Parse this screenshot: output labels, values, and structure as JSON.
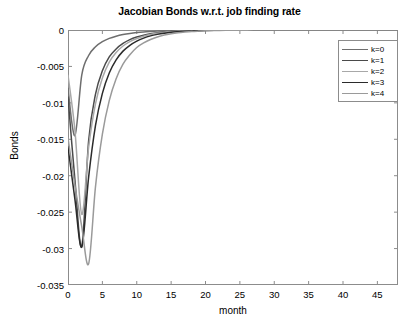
{
  "chart_data": {
    "type": "line",
    "title": "Jacobian Bonds w.r.t. job finding rate",
    "xlabel": "month",
    "ylabel": "Bonds",
    "xlim": [
      0,
      48
    ],
    "ylim": [
      -0.035,
      0
    ],
    "xticks": [
      0,
      5,
      10,
      15,
      20,
      25,
      30,
      35,
      40,
      45
    ],
    "xticklabels": [
      "0",
      "5",
      "10",
      "15",
      "20",
      "25",
      "30",
      "35",
      "40",
      "45"
    ],
    "yticks": [
      0,
      -0.005,
      -0.01,
      -0.015,
      -0.02,
      -0.025,
      -0.03,
      -0.035
    ],
    "yticklabels": [
      "0",
      "-0.005",
      "-0.01",
      "-0.015",
      "-0.02",
      "-0.025",
      "-0.03",
      "-0.035"
    ],
    "grid": false,
    "legend_position": "upper-right",
    "x": [
      0,
      1,
      2,
      3,
      4,
      5,
      6,
      7,
      8,
      9,
      10,
      11,
      12,
      13,
      14,
      15,
      16,
      17,
      18,
      19,
      20,
      22,
      24,
      26,
      28,
      30,
      32,
      34,
      36,
      38,
      40,
      42,
      44,
      46,
      48
    ],
    "series": [
      {
        "name": "k=0",
        "color": "#6e6e6e",
        "values": [
          -0.008,
          -0.0145,
          -0.0062,
          -0.0035,
          -0.0023,
          -0.0016,
          -0.00115,
          -0.00085,
          -0.00063,
          -0.00047,
          -0.00035,
          -0.00026,
          -0.0002,
          -0.00015,
          -0.00011,
          -8e-05,
          -6e-05,
          -4.5e-05,
          -3.3e-05,
          -2.5e-05,
          -1.9e-05,
          -1.1e-05,
          -6e-06,
          -3.5e-06,
          -2e-06,
          -1.2e-06,
          -7e-07,
          -4e-07,
          -2.5e-07,
          -1.5e-07,
          -9e-08,
          -5e-08,
          -3e-08,
          -2e-08,
          -1e-08
        ]
      },
      {
        "name": "k=1",
        "color": "#4a4a4a",
        "values": [
          -0.0092,
          -0.0205,
          -0.0297,
          -0.0152,
          -0.0088,
          -0.0056,
          -0.0037,
          -0.0026,
          -0.00185,
          -0.00133,
          -0.00097,
          -0.00071,
          -0.00052,
          -0.00038,
          -0.00028,
          -0.00021,
          -0.00015,
          -0.00011,
          -8e-05,
          -6e-05,
          -4.5e-05,
          -2.5e-05,
          -1.4e-05,
          -8e-06,
          -4.5e-06,
          -2.6e-06,
          -1.5e-06,
          -9e-07,
          -5e-07,
          -3e-07,
          -1.7e-07,
          -1e-07,
          -6e-08,
          -3e-08,
          -2e-08
        ]
      },
      {
        "name": "k=2",
        "color": "#a8a8a8",
        "values": [
          -0.0062,
          -0.0137,
          -0.0253,
          -0.0161,
          -0.0101,
          -0.0066,
          -0.0044,
          -0.0031,
          -0.0022,
          -0.0016,
          -0.00116,
          -0.00085,
          -0.00062,
          -0.00046,
          -0.00034,
          -0.00025,
          -0.00018,
          -0.00013,
          -0.0001,
          -7e-05,
          -5e-05,
          -3e-05,
          -1.7e-05,
          -1e-05,
          -5.5e-06,
          -3.2e-06,
          -1.8e-06,
          -1e-06,
          -6e-07,
          -3.5e-07,
          -2e-07,
          -1.2e-07,
          -7e-08,
          -4e-08,
          -2e-08
        ]
      },
      {
        "name": "k=3",
        "color": "#2b2b2b",
        "values": [
          -0.016,
          -0.0232,
          -0.0298,
          -0.0202,
          -0.0131,
          -0.0087,
          -0.0059,
          -0.0041,
          -0.0029,
          -0.0021,
          -0.00152,
          -0.00111,
          -0.00081,
          -0.0006,
          -0.00044,
          -0.00032,
          -0.00024,
          -0.00017,
          -0.00013,
          -9e-05,
          -7e-05,
          -4e-05,
          -2.2e-05,
          -1.2e-05,
          -7e-06,
          -4e-06,
          -2.3e-06,
          -1.3e-06,
          -8e-07,
          -4.5e-07,
          -2.6e-07,
          -1.5e-07,
          -9e-08,
          -5e-08,
          -3e-08
        ]
      },
      {
        "name": "k=4",
        "color": "#9a9a9a",
        "values": [
          -0.0148,
          -0.0213,
          -0.027,
          -0.0321,
          -0.0215,
          -0.0143,
          -0.0097,
          -0.0067,
          -0.0047,
          -0.0034,
          -0.0024,
          -0.00177,
          -0.0013,
          -0.00095,
          -0.0007,
          -0.00052,
          -0.00038,
          -0.00028,
          -0.0002,
          -0.00015,
          -0.00011,
          -6e-05,
          -3.4e-05,
          -1.9e-05,
          -1.1e-05,
          -6e-06,
          -3.5e-06,
          -2e-06,
          -1.2e-06,
          -7e-07,
          -4e-07,
          -2.3e-07,
          -1.3e-07,
          -8e-08,
          -4e-08
        ]
      }
    ]
  },
  "legend": {
    "items": [
      {
        "label": "k=0"
      },
      {
        "label": "k=1"
      },
      {
        "label": "k=2"
      },
      {
        "label": "k=3"
      },
      {
        "label": "k=4"
      }
    ]
  }
}
